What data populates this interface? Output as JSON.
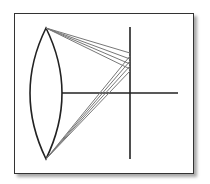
{
  "diagram": {
    "type": "optical lens aberration diagram",
    "colors": {
      "frame": "#333333",
      "lens": "#222222",
      "axis": "#222222",
      "rays": "#777777"
    },
    "lens": {
      "top": [
        46,
        28
      ],
      "bottom": [
        46,
        159
      ],
      "left_x": 30,
      "right_x": 62
    },
    "optical_axis": {
      "x1": 62,
      "x2": 178,
      "y": 93
    },
    "image_plane": {
      "x": 130,
      "y1": 27,
      "y2": 159
    },
    "rays_top": [
      {
        "from": [
          46,
          28
        ],
        "to": [
          130,
          53
        ]
      },
      {
        "from": [
          46,
          28
        ],
        "to": [
          130,
          59
        ]
      },
      {
        "from": [
          46,
          28
        ],
        "to": [
          130,
          64
        ]
      },
      {
        "from": [
          46,
          28
        ],
        "to": [
          130,
          69
        ]
      }
    ],
    "rays_bottom": [
      {
        "from": [
          46,
          159
        ],
        "to": [
          130,
          56
        ]
      },
      {
        "from": [
          46,
          159
        ],
        "to": [
          130,
          61
        ]
      },
      {
        "from": [
          46,
          159
        ],
        "to": [
          130,
          66
        ]
      },
      {
        "from": [
          46,
          159
        ],
        "to": [
          130,
          71
        ]
      }
    ]
  }
}
